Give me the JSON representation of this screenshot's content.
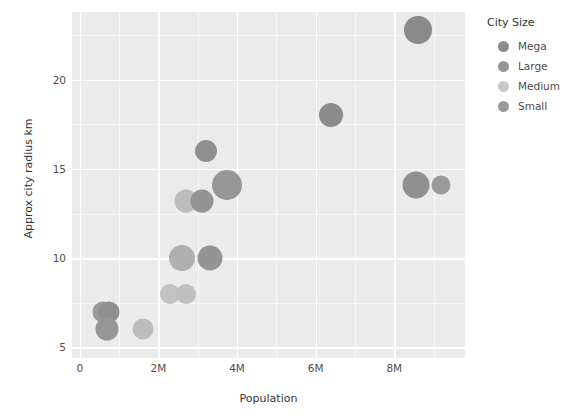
{
  "chart_data": {
    "type": "scatter",
    "title": "",
    "xlabel": "Population",
    "ylabel": "Approx city radius km",
    "xlim": [
      -200000,
      9800000
    ],
    "ylim": [
      4.4,
      23.8
    ],
    "xticks": [
      0,
      2000000,
      4000000,
      6000000,
      8000000
    ],
    "xticklabels": [
      "0",
      "2M",
      "4M",
      "6M",
      "8M"
    ],
    "yticks": [
      5,
      10,
      15,
      20
    ],
    "yticklabels": [
      "5",
      "10",
      "15",
      "20"
    ],
    "grid": true,
    "size_encoding": "City Size",
    "legend": {
      "title": "City Size",
      "position": "right",
      "entries": [
        {
          "label": "Mega",
          "color": "#8c8c8c"
        },
        {
          "label": "Large",
          "color": "#969696"
        },
        {
          "label": "Medium",
          "color": "#c8c8c8"
        },
        {
          "label": "Small",
          "color": "#9a9a9a"
        }
      ]
    },
    "points": [
      {
        "x": 600000,
        "y": 7.0,
        "size": "Small",
        "r": 10.5,
        "color": "#9a9a9a"
      },
      {
        "x": 750000,
        "y": 7.0,
        "size": "Small",
        "r": 10.5,
        "color": "#8f8f8f"
      },
      {
        "x": 700000,
        "y": 6.0,
        "size": "Small",
        "r": 11.5,
        "color": "#969696"
      },
      {
        "x": 1600000,
        "y": 6.0,
        "size": "Medium",
        "r": 10.5,
        "color": "#bdbdbd"
      },
      {
        "x": 2300000,
        "y": 8.0,
        "size": "Medium",
        "r": 10.0,
        "color": "#c2c2c2"
      },
      {
        "x": 2700000,
        "y": 8.0,
        "size": "Medium",
        "r": 10.0,
        "color": "#bfbfbf"
      },
      {
        "x": 2600000,
        "y": 10.0,
        "size": "Large",
        "r": 13.0,
        "color": "#b0b0b0"
      },
      {
        "x": 3300000,
        "y": 10.0,
        "size": "Large",
        "r": 12.5,
        "color": "#949494"
      },
      {
        "x": 2700000,
        "y": 13.2,
        "size": "Medium",
        "r": 11.5,
        "color": "#bdbdbd"
      },
      {
        "x": 3100000,
        "y": 13.2,
        "size": "Large",
        "r": 11.5,
        "color": "#949494"
      },
      {
        "x": 3200000,
        "y": 16.0,
        "size": "Large",
        "r": 11.0,
        "color": "#8f8f8f"
      },
      {
        "x": 3750000,
        "y": 14.1,
        "size": "Mega",
        "r": 15.0,
        "color": "#969696"
      },
      {
        "x": 6400000,
        "y": 18.0,
        "size": "Large",
        "r": 12.0,
        "color": "#8c8c8c"
      },
      {
        "x": 8600000,
        "y": 22.8,
        "size": "Mega",
        "r": 14.0,
        "color": "#8a8a8a"
      },
      {
        "x": 8550000,
        "y": 14.1,
        "size": "Mega",
        "r": 13.5,
        "color": "#8f8f8f"
      },
      {
        "x": 9200000,
        "y": 14.1,
        "size": "Small",
        "r": 9.5,
        "color": "#9a9a9a"
      }
    ]
  },
  "style": {
    "panel_background": "#ebebeb",
    "gridline_major": "#ffffff",
    "gridline_minor": "#f7f7f7",
    "tick_text": "#4d4d4d",
    "axis_title": "#333333"
  }
}
